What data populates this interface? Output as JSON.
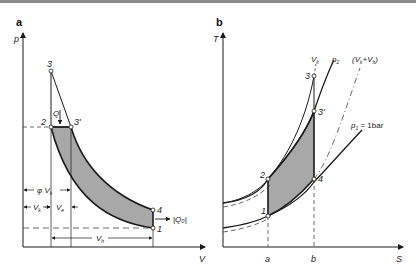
{
  "panels": [
    {
      "id": "a",
      "label": "a",
      "axes": {
        "y": "p",
        "x": "V"
      },
      "points": {
        "p1": "1",
        "p2": "2",
        "p3": "3",
        "p3p": "3'",
        "p4": "4"
      },
      "heat_in": "Q",
      "heat_out": "|Q₀|",
      "dims": {
        "phiVk": "φ V",
        "phiVk_sub": "k",
        "Vk": "V",
        "Vk_sub": "k",
        "Ve": "V",
        "Ve_sub": "e",
        "Vh": "V",
        "Vh_sub": "h"
      }
    },
    {
      "id": "b",
      "label": "b",
      "axes": {
        "y": "T",
        "x": "S"
      },
      "points": {
        "p1": "1",
        "p2": "2",
        "p3": "3",
        "p3p": "3'",
        "p4": "4"
      },
      "curve_labels": {
        "Vk": "V",
        "Vk_sub": "k",
        "p2": "p",
        "p2_sub": "2",
        "VkVh": "(V",
        "VkVh_sub1": "k",
        "VkVh_mid": "+V",
        "VkVh_sub2": "h",
        "VkVh_end": ")",
        "p1": "p",
        "p1_sub": "1",
        "p1_val": " = 1bar"
      },
      "ticks": {
        "a": "a",
        "b": "b"
      }
    }
  ],
  "colors": {
    "fill": "#a8a8a8",
    "line": "#1a1a1a",
    "dash": "#444444"
  }
}
